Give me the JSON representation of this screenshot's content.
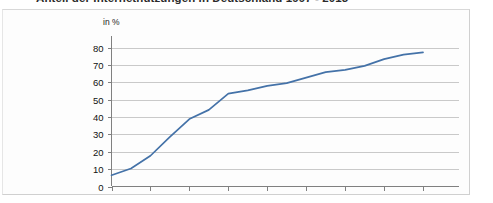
{
  "title": "Anteil der Internetnutzungen in Deutschland 1997 - 2013",
  "unit_label": "in %",
  "colors": {
    "line": "#4472a8",
    "grid": "#c9c9c9",
    "axis": "#808080",
    "text": "#111111",
    "card_background": "#fdfdfd"
  },
  "chart_data": {
    "type": "line",
    "title": "Anteil der Internetnutzungen in Deutschland 1997 - 2013",
    "xlabel": "",
    "ylabel": "in %",
    "ylim": [
      0,
      80
    ],
    "xlim": [
      1997,
      2013
    ],
    "grid": true,
    "legend": false,
    "ytick_labels": [
      "0",
      "10",
      "20",
      "30",
      "40",
      "50",
      "60",
      "70",
      "80"
    ],
    "ytick_values": [
      0,
      10,
      20,
      30,
      40,
      50,
      60,
      70,
      80
    ],
    "xtick_labels": [
      "1997",
      "1999",
      "2001",
      "2003",
      "2005",
      "2007",
      "2009",
      "2011",
      "2013"
    ],
    "xtick_values": [
      1997,
      1999,
      2001,
      2003,
      2005,
      2007,
      2009,
      2011,
      2013
    ],
    "x": [
      1997,
      1998,
      1999,
      2000,
      2001,
      2002,
      2003,
      2004,
      2005,
      2006,
      2007,
      2008,
      2009,
      2010,
      2011,
      2012,
      2013
    ],
    "values": [
      6.5,
      10.4,
      17.7,
      28.6,
      38.8,
      44.1,
      53.5,
      55.3,
      57.9,
      59.5,
      62.7,
      65.8,
      67.1,
      69.4,
      73.3,
      75.9,
      77.2
    ],
    "series": [
      {
        "name": "Internetnutzer",
        "values": [
          6.5,
          10.4,
          17.7,
          28.6,
          38.8,
          44.1,
          53.5,
          55.3,
          57.9,
          59.5,
          62.7,
          65.8,
          67.1,
          69.4,
          73.3,
          75.9,
          77.2
        ]
      }
    ]
  }
}
